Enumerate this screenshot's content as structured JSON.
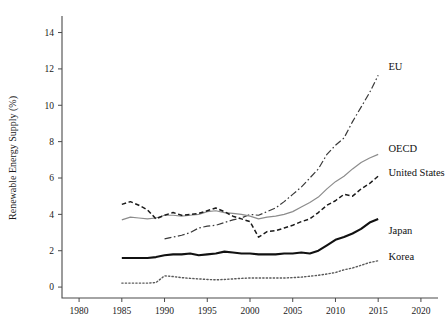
{
  "chart_data": {
    "type": "line",
    "title": "",
    "xlabel": "",
    "ylabel": "Renewable Energy Supply (%)",
    "xlim": [
      1978,
      2022
    ],
    "ylim": [
      -0.6,
      14.8
    ],
    "xticks": [
      1980,
      1985,
      1990,
      1995,
      2000,
      2005,
      2010,
      2015,
      2020
    ],
    "yticks": [
      0,
      2,
      4,
      6,
      8,
      10,
      12,
      14
    ],
    "grid": false,
    "legend_position": "inline-right-of-line-ends",
    "series": [
      {
        "name": "EU",
        "style": "dashdot",
        "color": "#3a3a3a",
        "width": 1.2,
        "label_x": 2016.2,
        "label_y": 12.05,
        "x": [
          1990,
          1991,
          1992,
          1993,
          1994,
          1995,
          1996,
          1997,
          1998,
          1999,
          2000,
          2001,
          2002,
          2003,
          2004,
          2005,
          2006,
          2007,
          2008,
          2009,
          2010,
          2011,
          2012,
          2013,
          2014,
          2015
        ],
        "y": [
          2.65,
          2.75,
          2.85,
          3.0,
          3.25,
          3.35,
          3.4,
          3.55,
          3.7,
          3.8,
          4.0,
          3.95,
          4.15,
          4.35,
          4.7,
          5.1,
          5.5,
          6.0,
          6.5,
          7.3,
          7.8,
          8.2,
          9.1,
          9.9,
          10.7,
          11.65
        ]
      },
      {
        "name": "OECD",
        "style": "solid-thin",
        "color": "#8c8c8c",
        "width": 1.2,
        "label_x": 2016.2,
        "label_y": 7.55,
        "x": [
          1985,
          1986,
          1987,
          1988,
          1989,
          1990,
          1991,
          1992,
          1993,
          1994,
          1995,
          1996,
          1997,
          1998,
          1999,
          2000,
          2001,
          2002,
          2003,
          2004,
          2005,
          2006,
          2007,
          2008,
          2009,
          2010,
          2011,
          2012,
          2013,
          2014,
          2015
        ],
        "y": [
          3.7,
          3.85,
          3.8,
          3.75,
          3.8,
          3.95,
          3.95,
          3.9,
          3.95,
          4.0,
          4.15,
          4.2,
          4.1,
          4.05,
          4.0,
          3.9,
          3.75,
          3.85,
          3.9,
          4.0,
          4.15,
          4.4,
          4.65,
          4.95,
          5.4,
          5.8,
          6.1,
          6.5,
          6.85,
          7.1,
          7.3
        ]
      },
      {
        "name": "United States",
        "style": "dashed",
        "color": "#1a1a1a",
        "width": 1.5,
        "label_x": 2016.2,
        "label_y": 6.25,
        "x": [
          1985,
          1986,
          1987,
          1988,
          1989,
          1990,
          1991,
          1992,
          1993,
          1994,
          1995,
          1996,
          1997,
          1998,
          1999,
          2000,
          2001,
          2002,
          2003,
          2004,
          2005,
          2006,
          2007,
          2008,
          2009,
          2010,
          2011,
          2012,
          2013,
          2014,
          2015
        ],
        "y": [
          4.55,
          4.7,
          4.5,
          4.25,
          3.75,
          3.95,
          4.1,
          3.95,
          4.0,
          4.05,
          4.2,
          4.35,
          4.15,
          3.9,
          3.75,
          3.6,
          2.75,
          3.05,
          3.1,
          3.25,
          3.4,
          3.6,
          3.75,
          4.1,
          4.5,
          4.75,
          5.1,
          5.0,
          5.4,
          5.7,
          6.1
        ]
      },
      {
        "name": "Japan",
        "style": "solid-thick",
        "color": "#111111",
        "width": 2.1,
        "label_x": 2016.2,
        "label_y": 3.05,
        "x": [
          1985,
          1986,
          1987,
          1988,
          1989,
          1990,
          1991,
          1992,
          1993,
          1994,
          1995,
          1996,
          1997,
          1998,
          1999,
          2000,
          2001,
          2002,
          2003,
          2004,
          2005,
          2006,
          2007,
          2008,
          2009,
          2010,
          2011,
          2012,
          2013,
          2014,
          2015
        ],
        "y": [
          1.6,
          1.6,
          1.6,
          1.6,
          1.65,
          1.75,
          1.8,
          1.8,
          1.85,
          1.75,
          1.8,
          1.85,
          1.95,
          1.9,
          1.85,
          1.85,
          1.8,
          1.8,
          1.8,
          1.85,
          1.85,
          1.9,
          1.85,
          2.0,
          2.3,
          2.6,
          2.75,
          2.95,
          3.2,
          3.55,
          3.75
        ]
      },
      {
        "name": "Korea",
        "style": "dotted",
        "color": "#5a5a5a",
        "width": 1.4,
        "label_x": 2016.2,
        "label_y": 1.6,
        "x": [
          1985,
          1986,
          1987,
          1988,
          1989,
          1990,
          1991,
          1992,
          1993,
          1994,
          1995,
          1996,
          1997,
          1998,
          1999,
          2000,
          2001,
          2002,
          2003,
          2004,
          2005,
          2006,
          2007,
          2008,
          2009,
          2010,
          2011,
          2012,
          2013,
          2014,
          2015
        ],
        "y": [
          0.22,
          0.22,
          0.22,
          0.22,
          0.25,
          0.62,
          0.58,
          0.52,
          0.48,
          0.45,
          0.42,
          0.4,
          0.42,
          0.45,
          0.48,
          0.5,
          0.5,
          0.5,
          0.5,
          0.5,
          0.52,
          0.55,
          0.6,
          0.65,
          0.72,
          0.8,
          0.95,
          1.05,
          1.2,
          1.35,
          1.45
        ]
      }
    ]
  },
  "figure": {
    "background": "#ffffff",
    "axis_color": "#4a4a4a"
  }
}
